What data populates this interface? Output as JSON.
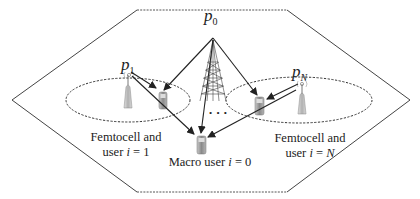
{
  "diagram": {
    "type": "femtocell network",
    "boundary": {
      "shape": "hexagon",
      "style": "dashed"
    },
    "power_labels": {
      "p0": {
        "base": "p",
        "sub": "0"
      },
      "p1": {
        "base": "p",
        "sub": "1"
      },
      "pN": {
        "base": "p",
        "sub": "N"
      }
    },
    "captions": {
      "femto1_line1": "Femtocell and",
      "femto1_line2_prefix": "user ",
      "femto1_var": "i",
      "femto1_eq": " = 1",
      "femtoN_line1": "Femtocell and",
      "femtoN_line2_prefix": "user ",
      "femtoN_var": "i",
      "femtoN_eq": " = ",
      "femtoN_val": "N",
      "macro_prefix": "Macro user ",
      "macro_var": "i",
      "macro_eq": " = 0"
    },
    "ellipsis": "• • •",
    "nodes": [
      {
        "id": "macro-bs",
        "icon": "cell-tower-icon"
      },
      {
        "id": "femto-bs-1",
        "icon": "femto-access-point-icon"
      },
      {
        "id": "femto-bs-N",
        "icon": "femto-access-point-icon"
      },
      {
        "id": "femto-user-1",
        "icon": "mobile-phone-icon"
      },
      {
        "id": "femto-user-N",
        "icon": "mobile-phone-icon"
      },
      {
        "id": "macro-user-0",
        "icon": "mobile-phone-icon"
      }
    ],
    "colors": {
      "line": "#222222",
      "dashed": "#555555",
      "device": "#9a9a9a"
    }
  }
}
